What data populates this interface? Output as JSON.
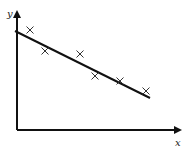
{
  "chart_data": {
    "type": "scatter",
    "title": "",
    "xlabel": "x",
    "ylabel": "y",
    "grid": false,
    "legend": null,
    "ticks": "none",
    "points": [
      {
        "x": 13,
        "y": 100
      },
      {
        "x": 28,
        "y": 79
      },
      {
        "x": 63,
        "y": 76
      },
      {
        "x": 78,
        "y": 54
      },
      {
        "x": 103,
        "y": 49
      },
      {
        "x": 129,
        "y": 39
      }
    ],
    "fit_line": {
      "x0": -2,
      "y0": 99,
      "x1": 133,
      "y1": 32
    },
    "colors": {
      "axis": "#111111",
      "line": "#111111",
      "marker": "#333333"
    }
  },
  "labels": {
    "x_axis": "x",
    "y_axis": "y"
  }
}
